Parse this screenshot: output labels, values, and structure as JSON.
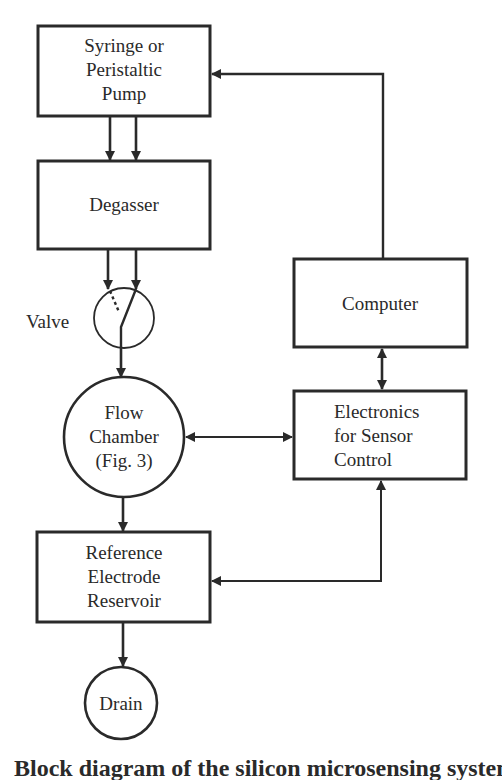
{
  "diagram": {
    "nodes": {
      "pump": {
        "lines": [
          "Syringe or",
          "Peristaltic",
          "Pump"
        ]
      },
      "degasser": {
        "lines": [
          "Degasser"
        ]
      },
      "valve": {
        "label": "Valve"
      },
      "flow_chamber": {
        "lines": [
          "Flow",
          "Chamber",
          "(Fig. 3)"
        ]
      },
      "reference": {
        "lines": [
          "Reference",
          "Electrode",
          "Reservoir"
        ]
      },
      "drain": {
        "lines": [
          "Drain"
        ]
      },
      "computer": {
        "lines": [
          "Computer"
        ]
      },
      "electronics": {
        "lines": [
          "Electronics",
          "for Sensor",
          "Control"
        ]
      }
    },
    "edges": [
      {
        "from": "pump",
        "to": "degasser",
        "count": 2
      },
      {
        "from": "degasser",
        "to": "valve",
        "count": 2
      },
      {
        "from": "valve",
        "to": "flow_chamber"
      },
      {
        "from": "flow_chamber",
        "to": "reference"
      },
      {
        "from": "reference",
        "to": "drain"
      },
      {
        "from": "computer",
        "to": "pump"
      },
      {
        "from": "computer",
        "to": "electronics",
        "bidirectional": true
      },
      {
        "from": "flow_chamber",
        "to": "electronics",
        "bidirectional": true
      },
      {
        "from": "reference",
        "to": "electronics",
        "bidirectional": true
      }
    ],
    "colors": {
      "ink": "#2a2a2a",
      "background": "#ffffff"
    }
  },
  "caption": {
    "text": "Block diagram of the silicon microsensing system"
  }
}
